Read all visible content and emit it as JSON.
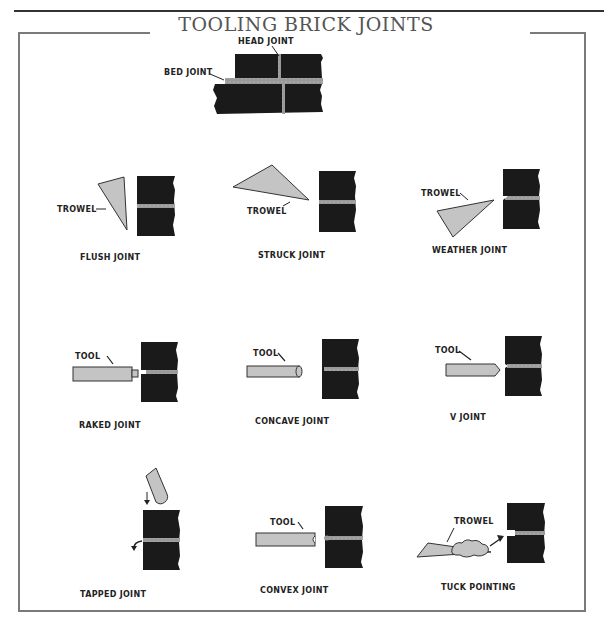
{
  "page": {
    "header_text": "CHAPTER",
    "title": "TOOLING BRICK JOINTS"
  },
  "colors": {
    "brick": "#1a1a1a",
    "mortar": "#9a9a9a",
    "tool_fill": "#c4c4c4",
    "frame": "#7a7a7a",
    "title": "#555555"
  },
  "top_diagram": {
    "labels": {
      "head_joint": "HEAD JOINT",
      "bed_joint": "BED JOINT"
    }
  },
  "panels": [
    {
      "name": "FLUSH JOINT",
      "tool_label": "TROWEL"
    },
    {
      "name": "STRUCK JOINT",
      "tool_label": "TROWEL"
    },
    {
      "name": "WEATHER JOINT",
      "tool_label": "TROWEL"
    },
    {
      "name": "RAKED JOINT",
      "tool_label": "TOOL"
    },
    {
      "name": "CONCAVE JOINT",
      "tool_label": "TOOL"
    },
    {
      "name": "V JOINT",
      "tool_label": "TOOL"
    },
    {
      "name": "TAPPED JOINT",
      "tool_label": ""
    },
    {
      "name": "CONVEX JOINT",
      "tool_label": "TOOL"
    },
    {
      "name": "TUCK POINTING",
      "tool_label": "TROWEL"
    }
  ]
}
